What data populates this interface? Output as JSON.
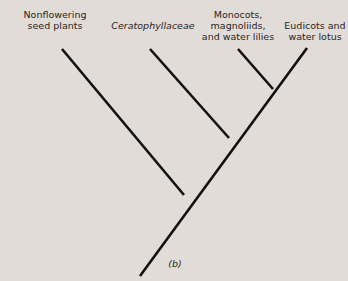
{
  "diagram": {
    "type": "cladogram",
    "caption": "(b)",
    "taxa": [
      {
        "label_line1": "Nonflowering",
        "label_line2": "seed plants",
        "italic": false
      },
      {
        "label_line1": "Ceratophyllaceae",
        "italic": true
      },
      {
        "label_line1": "Monocots,",
        "label_line2": "magnoliids,",
        "label_line3": "and water lilies",
        "italic": false
      },
      {
        "label_line1": "Eudicots and",
        "label_line2": "water lotus",
        "italic": false
      }
    ],
    "line_color": "#111111",
    "background_color": "#e2dcd8"
  }
}
